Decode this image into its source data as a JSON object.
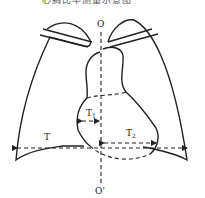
{
  "figure": {
    "caption_cut": "心胸比率测量示意图",
    "labels": {
      "top_axis": "O",
      "bottom_axis": "O'",
      "T": "T",
      "T1": "T",
      "T1_sub": "1",
      "T2": "T",
      "T2_sub": "2"
    },
    "colors": {
      "stroke": "#222222",
      "background": "#ffffff"
    }
  }
}
